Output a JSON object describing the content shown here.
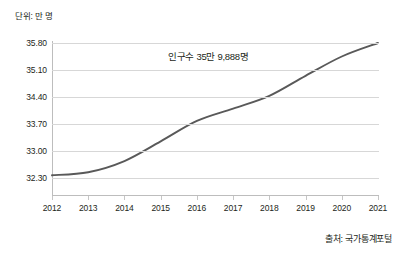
{
  "unit_label": "단위: 만 명",
  "source_label": "출처: 국가통계포털",
  "annotation": "인구수 35만 9,888명",
  "colors": {
    "line": "#595959",
    "gridline": "#d7d7d7",
    "axis": "#bdbdbd",
    "text": "#231f20",
    "background": "#ffffff"
  },
  "chart_data": {
    "type": "line",
    "title": "",
    "subtitle": "",
    "xlabel": "",
    "ylabel": "단위: 만 명",
    "categories": [
      "2012",
      "2013",
      "2014",
      "2015",
      "2016",
      "2017",
      "2018",
      "2019",
      "2020",
      "2021"
    ],
    "x": [
      2012,
      2013,
      2014,
      2015,
      2016,
      2017,
      2018,
      2019,
      2020,
      2021
    ],
    "values": [
      32.37,
      32.45,
      32.74,
      33.25,
      33.78,
      34.1,
      34.43,
      34.95,
      35.45,
      35.8
    ],
    "series": [
      {
        "name": "인구수",
        "values": [
          32.37,
          32.45,
          32.74,
          33.25,
          33.78,
          34.1,
          34.43,
          34.95,
          35.45,
          35.8
        ]
      }
    ],
    "ytick_labels": [
      "35.80",
      "35.10",
      "34.40",
      "33.70",
      "33.00",
      "32.30"
    ],
    "ytick_values": [
      35.8,
      35.1,
      34.4,
      33.7,
      33.0,
      32.3
    ],
    "ylim": [
      31.95,
      35.8
    ],
    "grid": true,
    "legend": false,
    "legend_position": "none",
    "annotations": [
      {
        "text": "인구수 35만 9,888명",
        "x": 2016,
        "y": 35.3
      }
    ],
    "smooth": true,
    "markers": false
  }
}
